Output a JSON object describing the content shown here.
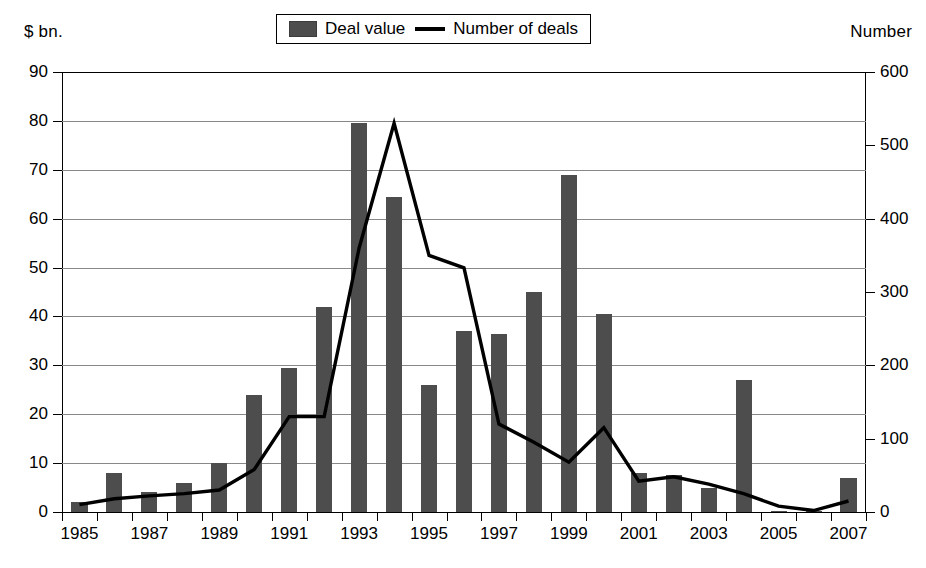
{
  "chart_data": {
    "type": "bar",
    "title": "",
    "subtitle": "",
    "xlabel": "",
    "ylabel": "$ bn.",
    "y2label": "Number",
    "grid": true,
    "legend_position": "top-center",
    "ylim": [
      0,
      90
    ],
    "y2lim": [
      0,
      600
    ],
    "yticks": [
      "0",
      "10",
      "20",
      "30",
      "40",
      "50",
      "60",
      "70",
      "80",
      "90"
    ],
    "y2ticks": [
      "0",
      "100",
      "200",
      "300",
      "400",
      "500",
      "600"
    ],
    "categories": [
      "1985",
      "1986",
      "1987",
      "1988",
      "1989",
      "1990",
      "1991",
      "1992",
      "1993",
      "1994",
      "1995",
      "1996",
      "1997",
      "1998",
      "1999",
      "2000",
      "2001",
      "2002",
      "2003",
      "2004",
      "2005",
      "2006",
      "2007"
    ],
    "xtick_labels": [
      "1985",
      "",
      "1987",
      "",
      "1989",
      "",
      "1991",
      "",
      "1993",
      "",
      "1995",
      "",
      "1997",
      "",
      "1999",
      "",
      "2001",
      "",
      "2003",
      "",
      "2005",
      "",
      "2007"
    ],
    "series": [
      {
        "name": "Deal value",
        "kind": "bar",
        "axis": "left",
        "unit": "$ bn.",
        "color": "#4d4d4d",
        "values": [
          2,
          8,
          4,
          6,
          10,
          24,
          29.5,
          42,
          79.5,
          64.5,
          26,
          37,
          36.5,
          45,
          69,
          40.5,
          8,
          7.5,
          5,
          27,
          0.3,
          0.3,
          7
        ]
      },
      {
        "name": "Number of deals",
        "kind": "line",
        "axis": "right",
        "unit": "Number",
        "color": "#000000",
        "values": [
          10,
          18,
          22,
          25,
          30,
          58,
          130,
          130,
          360,
          530,
          350,
          333,
          120,
          95,
          68,
          115,
          42,
          48,
          38,
          25,
          8,
          2,
          15
        ]
      }
    ]
  },
  "legend": {
    "items": [
      {
        "label": "Deal value",
        "marker": "swatch"
      },
      {
        "label": "Number of deals",
        "marker": "line"
      }
    ]
  },
  "captions": {
    "left": "$ bn.",
    "right": "Number"
  }
}
